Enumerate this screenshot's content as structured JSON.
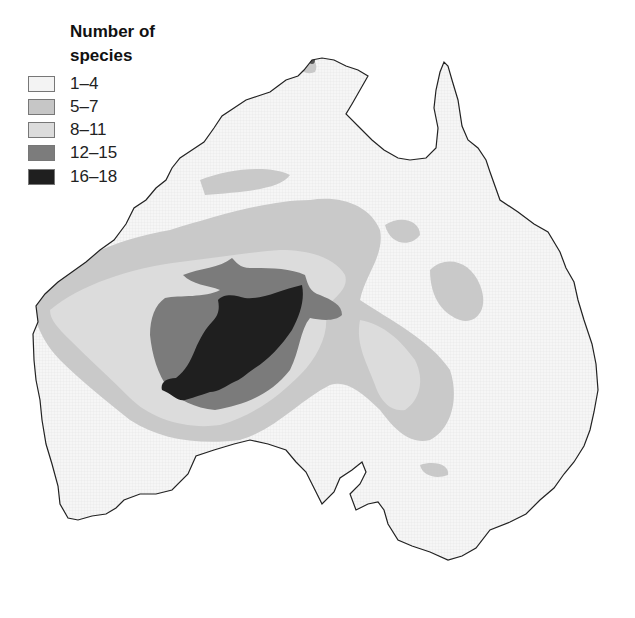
{
  "legend": {
    "title_line1": "Number of",
    "title_line2": "species",
    "classes": [
      {
        "label": "1–4",
        "color": "#f3f3f3"
      },
      {
        "label": "5–7",
        "color": "#c6c6c6"
      },
      {
        "label": "8–11",
        "color": "#dcdcdc"
      },
      {
        "label": "12–15",
        "color": "#7c7c7c"
      },
      {
        "label": "16–18",
        "color": "#1f1f1f"
      }
    ]
  },
  "map": {
    "region": "Australia (mainland)",
    "coastline_color": "#222222",
    "background_color": "#ffffff"
  }
}
